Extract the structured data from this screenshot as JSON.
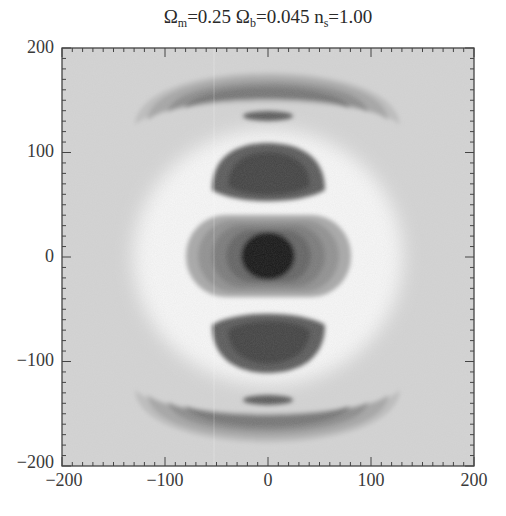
{
  "title": {
    "part1_symbol": "Ω",
    "part1_sub": "m",
    "part1_value": "=0.25 ",
    "part2_symbol": "Ω",
    "part2_sub": "b",
    "part2_value": "=0.045 ",
    "part3_symbol": "n",
    "part3_sub": "s",
    "part3_value": "=1.00"
  },
  "axes": {
    "x_ticks": [
      "−200",
      "−100",
      "0",
      "100",
      "200"
    ],
    "y_ticks": [
      "200",
      "100",
      "0",
      "−100",
      "−200"
    ]
  },
  "colors": {
    "background": "#d4d4d4",
    "level_light": "#ececec",
    "level_white": "#f6f6f6",
    "level_1": "#b8b8b8",
    "level_2": "#9a9a9a",
    "level_3": "#7c7c7c",
    "level_4": "#5e5e5e",
    "level_5": "#3a3a3a",
    "level_core": "#141414"
  },
  "chart_data": {
    "type": "heatmap",
    "subtype": "filled_contour_grayscale",
    "title": "Ωm=0.25 Ωb=0.045 ns=1.00",
    "xlabel": "",
    "ylabel": "",
    "xlim": [
      -200,
      200
    ],
    "ylim": [
      -200,
      200
    ],
    "x_ticks": [
      -200,
      -100,
      0,
      100,
      200
    ],
    "y_ticks": [
      -200,
      -100,
      0,
      100,
      200
    ],
    "minor_ticks": true,
    "grid": false,
    "legend": null,
    "features": [
      {
        "name": "central peak",
        "center": [
          0,
          0
        ],
        "shape": "ellipse",
        "semi_axes": [
          105,
          55
        ],
        "levels": 5,
        "darkest_core_radius": 20,
        "sign": "dark"
      },
      {
        "name": "upper inner lobe",
        "center": [
          0,
          80
        ],
        "shape": "ellipse",
        "semi_axes": [
          60,
          35
        ],
        "sign": "dark"
      },
      {
        "name": "lower inner lobe",
        "center": [
          0,
          -80
        ],
        "shape": "ellipse",
        "semi_axes": [
          60,
          35
        ],
        "sign": "dark"
      },
      {
        "name": "bright ring",
        "center": [
          0,
          0
        ],
        "shape": "ring",
        "radius": 125,
        "sign": "light"
      },
      {
        "name": "upper outer arc",
        "center": [
          0,
          140
        ],
        "shape": "crescent",
        "extent_x": [
          -120,
          120
        ],
        "extent_y": [
          95,
          200
        ],
        "levels": 4,
        "sign": "dark"
      },
      {
        "name": "lower outer arc",
        "center": [
          0,
          -140
        ],
        "shape": "crescent",
        "extent_x": [
          -120,
          120
        ],
        "extent_y": [
          -200,
          -95
        ],
        "levels": 4,
        "sign": "dark"
      }
    ]
  }
}
